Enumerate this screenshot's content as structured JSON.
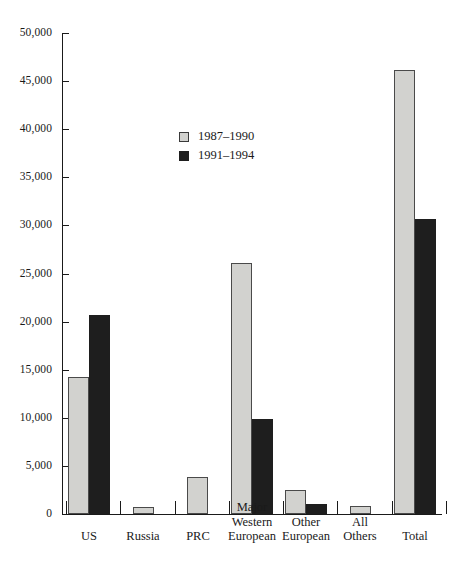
{
  "chart_data": {
    "type": "bar",
    "title": "",
    "subtitle": "",
    "xlabel": "",
    "ylabel": "",
    "ylim": [
      0,
      50000
    ],
    "ytick_values": [
      0,
      5000,
      10000,
      15000,
      20000,
      25000,
      30000,
      35000,
      40000,
      45000,
      50000
    ],
    "ytick_labels": [
      "0",
      "5,000",
      "10,000",
      "15,000",
      "20,000",
      "25,000",
      "30,000",
      "35,000",
      "40,000",
      "45,000",
      "50,000"
    ],
    "grid": false,
    "legend_position": "upper-center-left",
    "categories": [
      "US",
      "Russia",
      "PRC",
      "Major\nWestern\nEuropean",
      "Other\nEuropean",
      "All\nOthers",
      "Total"
    ],
    "series": [
      {
        "name": "1987–1990",
        "color": "#d2d2cf",
        "values": [
          14200,
          700,
          3800,
          26100,
          2500,
          800,
          46200
        ]
      },
      {
        "name": "1991–1994",
        "color": "#1e1e1e",
        "values": [
          20700,
          0,
          0,
          9900,
          1000,
          0,
          30700
        ]
      }
    ]
  },
  "legend": {
    "items": [
      {
        "label": "1987–1990",
        "swatch": "light"
      },
      {
        "label": "1991–1994",
        "swatch": "dark"
      }
    ]
  }
}
